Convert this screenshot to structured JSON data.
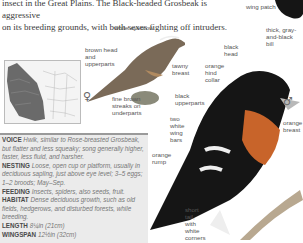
{
  "intro": {
    "line1": "insect in the Great Plains. The Black-headed Grosbeak is aggressive",
    "line2": "on its breeding grounds, with both sexes fighting off intruders."
  },
  "female_labels": {
    "white_eyebrow": "white eyebrow",
    "brown_head": "brown head and upperparts",
    "tawny_breast": "tawny breast",
    "fine_streaks": "fine brown streaks on underparts",
    "symbol": "♀"
  },
  "male_labels": {
    "wing_patch": "wing patch",
    "bill": "thick, gray-and-black bill",
    "black_head": "black head",
    "hind_collar": "orange hind collar",
    "black_upperparts": "black upperparts",
    "wing_bars": "two white wing bars",
    "orange_breast": "orange breast",
    "orange_rump": "orange rump",
    "short_tail": "short tail, with white corners",
    "symbol": "♂"
  },
  "info": [
    {
      "key": "VOICE",
      "value": "Hwik, similar to Rose-breasted Grosbeak, but flatter and less squeaky; song generally higher, faster, less fluid, and harsher."
    },
    {
      "key": "NESTING",
      "value": "Loose, open cup or platform, usually in deciduous sapling, just above eye level; 3–5 eggs; 1–2 broods; May–Sep."
    },
    {
      "key": "FEEDING",
      "value": "Insects, spiders, also seeds, fruit."
    },
    {
      "key": "HABITAT",
      "value": "Dense deciduous growth, such as old fields, hedgerows, and disturbed forests, while breeding."
    },
    {
      "key": "LENGTH",
      "value": "8¼in (21cm)"
    },
    {
      "key": "WINGSPAN",
      "value": "12½in (32cm)"
    }
  ],
  "colors": {
    "orange": "#c8642a",
    "black": "#151515",
    "infobox_bg": "#ebebeb"
  }
}
